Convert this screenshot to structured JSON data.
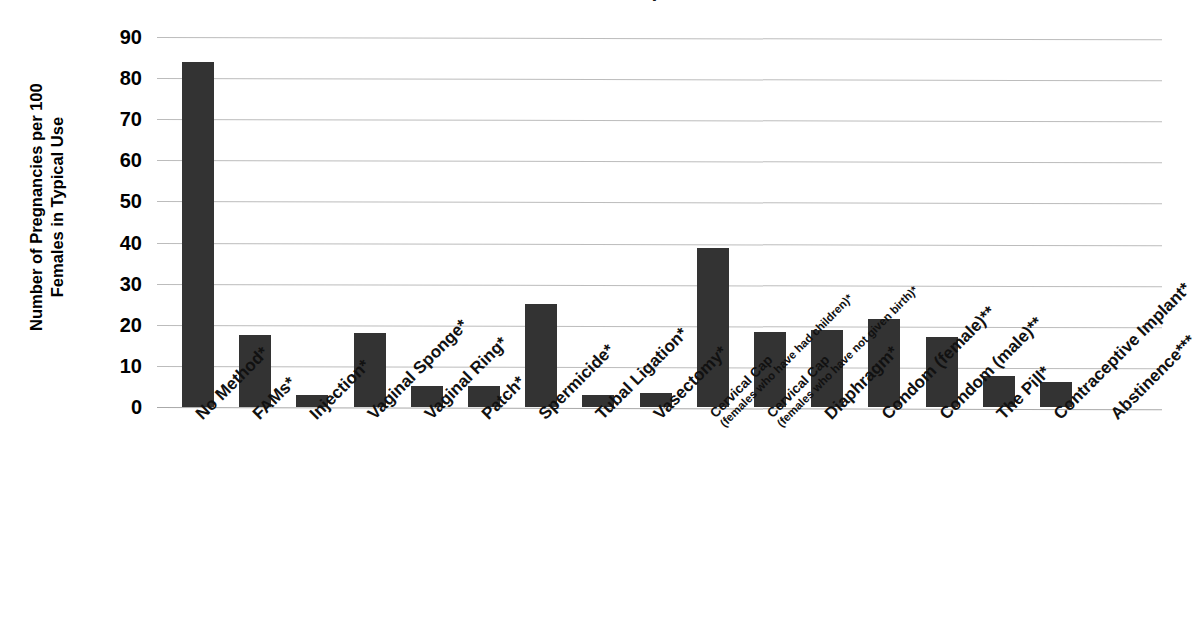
{
  "chart_data": {
    "type": "bar",
    "title": "Effectiveness of Contraceptive Methods",
    "xlabel": "",
    "ylabel": "Number of Pregnancies per 100 Females in Typical Use",
    "ylabel_lines": [
      "Number of Pregnancies per 100",
      "Females in Typical Use"
    ],
    "ylim": [
      0,
      90
    ],
    "ytick_step": 10,
    "yticks": [
      "90",
      "80",
      "70",
      "60",
      "50",
      "40",
      "30",
      "20",
      "10",
      "0"
    ],
    "grid": true,
    "legend": "none",
    "bar_color": "#333333",
    "gridline_color": "#bcbcbc",
    "categories": [
      "No Method*",
      "FAMs*",
      "Injection*",
      "Vaginal Sponge*",
      "Vaginal Ring*",
      "Patch*",
      "Spermicide*",
      "Tubal Ligation*",
      "Vasectomy*",
      "Cervical Cap",
      "Cervical Cap",
      "Diaphragm*",
      "Condom (female)**",
      "Condom (male)**",
      "The Pill*",
      "Contraceptive Implant*",
      "Abstinence***"
    ],
    "category_sublabels": [
      "",
      "",
      "",
      "",
      "",
      "",
      "",
      "",
      "",
      "(females who have had children)*",
      "(females who have not given birth)*",
      "",
      "",
      "",
      "",
      "",
      ""
    ],
    "values": [
      84,
      17.5,
      3,
      18,
      5,
      5,
      25,
      3,
      3.3,
      38.8,
      18.3,
      18.8,
      21.3,
      17,
      7.5,
      6,
      0
    ]
  }
}
